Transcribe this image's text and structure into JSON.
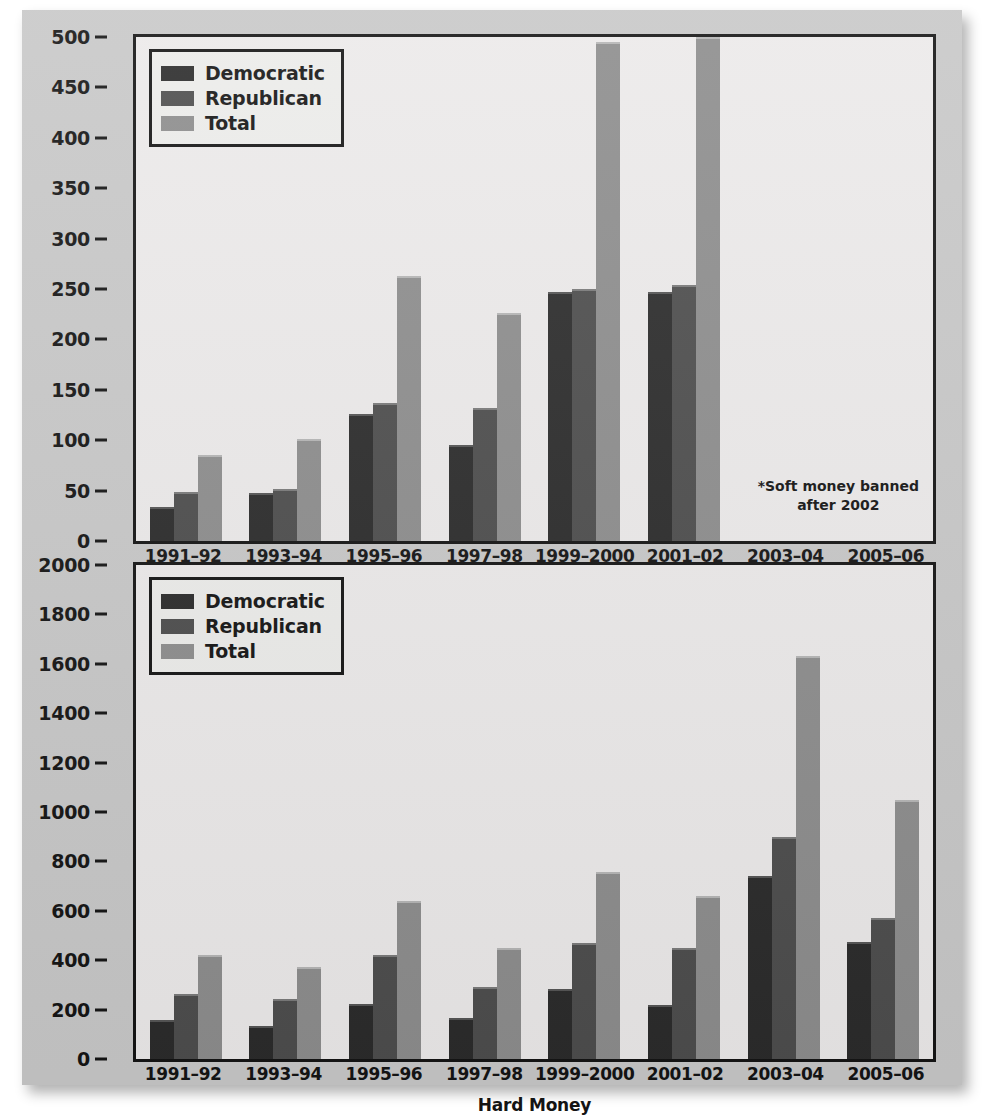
{
  "chart_data": [
    {
      "type": "bar",
      "id": "soft-money",
      "title": "",
      "xlabel": "Soft Money*",
      "ylabel": "",
      "ylim": [
        0,
        500
      ],
      "ytick_step": 50,
      "yticks": [
        0,
        50,
        100,
        150,
        200,
        250,
        300,
        350,
        400,
        450,
        500
      ],
      "categories": [
        "1991–92",
        "1993–94",
        "1995–96",
        "1997–98",
        "1999–2000",
        "2001–02",
        "2003–04",
        "2005–06"
      ],
      "series": [
        {
          "name": "Democratic",
          "color": "#2b2b2b",
          "values": [
            34,
            48,
            126,
            95,
            247,
            247,
            null,
            null
          ]
        },
        {
          "name": "Republican",
          "color": "#4d4d4d",
          "values": [
            49,
            52,
            137,
            132,
            250,
            254,
            null,
            null
          ]
        },
        {
          "name": "Total",
          "color": "#8d8d8d",
          "values": [
            85,
            101,
            263,
            226,
            495,
            500,
            null,
            null
          ]
        }
      ],
      "legend_position": "top-left",
      "grid": false,
      "annotation": {
        "line1": "*Soft money banned",
        "line2": "after 2002"
      }
    },
    {
      "type": "bar",
      "id": "hard-money",
      "title": "",
      "xlabel": "Hard Money",
      "ylabel": "",
      "ylim": [
        0,
        2000
      ],
      "ytick_step": 200,
      "yticks": [
        0,
        200,
        400,
        600,
        800,
        1000,
        1200,
        1400,
        1600,
        1800,
        2000
      ],
      "categories": [
        "1991–92",
        "1993–94",
        "1995–96",
        "1997–98",
        "1999–2000",
        "2001–02",
        "2003–04",
        "2005–06"
      ],
      "series": [
        {
          "name": "Democratic",
          "color": "#2b2b2b",
          "values": [
            158,
            134,
            224,
            165,
            282,
            220,
            742,
            475
          ]
        },
        {
          "name": "Republican",
          "color": "#4d4d4d",
          "values": [
            263,
            243,
            420,
            290,
            468,
            450,
            900,
            572
          ]
        },
        {
          "name": "Total",
          "color": "#8d8d8d",
          "values": [
            423,
            374,
            639,
            450,
            757,
            659,
            1633,
            1048
          ]
        }
      ],
      "legend_position": "top-left",
      "grid": false,
      "annotation": null
    }
  ],
  "legend": {
    "items": [
      {
        "label": "Democratic",
        "color": "#2b2b2b"
      },
      {
        "label": "Republican",
        "color": "#4d4d4d"
      },
      {
        "label": "Total",
        "color": "#8d8d8d"
      }
    ]
  },
  "colors": {
    "page_background": "#c8c8c8",
    "plot_background": "#eceaea",
    "axis": "#141414",
    "democratic": "#2b2b2b",
    "republican": "#4d4d4d",
    "total": "#8d8d8d"
  }
}
